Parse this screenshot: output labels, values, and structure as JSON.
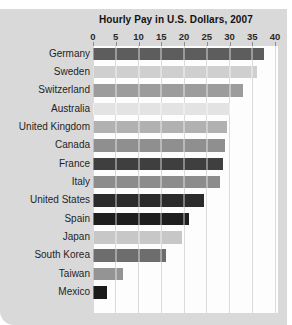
{
  "page": {
    "background_color": "#ffffff",
    "card_color": "#d9d9d9"
  },
  "chart_data": {
    "type": "bar",
    "orientation": "horizontal",
    "title": "Hourly Pay in U.S. Dollars, 2007",
    "categories": [
      "Germany",
      "Sweden",
      "Switzerland",
      "Australia",
      "United Kingdom",
      "Canada",
      "France",
      "Italy",
      "United States",
      "Spain",
      "Japan",
      "South Korea",
      "Taiwan",
      "Mexico"
    ],
    "values": [
      37.5,
      36,
      33,
      30,
      29.5,
      29,
      28.5,
      28,
      24.5,
      21,
      19.5,
      16,
      6.5,
      3
    ],
    "bar_colors": [
      "#5d5d5d",
      "#cfcfcf",
      "#9c9c9c",
      "#e3e3e3",
      "#b1b1b1",
      "#8f8f8f",
      "#3f3f3f",
      "#8c8c8c",
      "#2b2b2b",
      "#1e1e1e",
      "#c7c7c7",
      "#6d6d6d",
      "#949494",
      "#1a1a1a"
    ],
    "x_ticks": [
      0,
      5,
      10,
      15,
      20,
      25,
      30,
      35,
      40
    ],
    "xlim": [
      0,
      40
    ],
    "xlabel": "",
    "ylabel": "",
    "grid": true,
    "gridline_color": "#c5c5c5",
    "plot_background": "#fdfdfd",
    "legend": "none"
  }
}
